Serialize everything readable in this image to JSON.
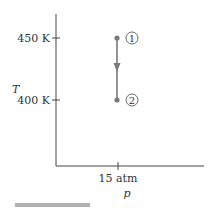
{
  "diagram": {
    "type": "T-p process diagram",
    "axes": {
      "y_label": "T",
      "x_label": "p",
      "y_ticks": [
        {
          "label": "450 K",
          "value": 450
        },
        {
          "label": "400 K",
          "value": 400
        }
      ],
      "x_ticks": [
        {
          "label": "15 atm",
          "value": 15
        }
      ]
    },
    "states": [
      {
        "id": "1",
        "label": "1",
        "T": "450 K",
        "p": "15 atm"
      },
      {
        "id": "2",
        "label": "2",
        "T": "400 K",
        "p": "15 atm"
      }
    ],
    "process": {
      "from": "1",
      "to": "2",
      "direction": "down"
    },
    "colors": {
      "axis": "#444444",
      "process_line": "#7a7a7a",
      "state_point": "#7a7a7a",
      "bottom_bar": "#b0b0b0"
    }
  }
}
